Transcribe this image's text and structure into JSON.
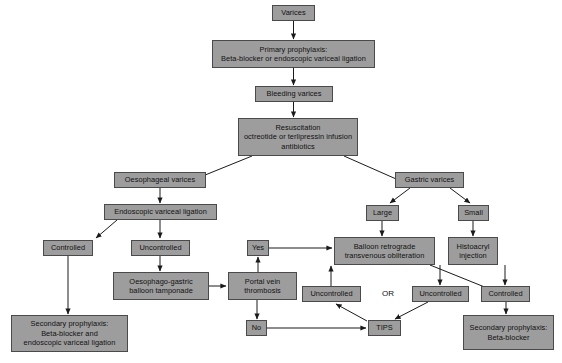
{
  "diagram": {
    "box_fill": "#9d9d9d",
    "box_border": "#4a4a4a",
    "arrow_color": "#1a1a1a",
    "canvas": {
      "width": 562,
      "height": 363
    },
    "nodes": [
      {
        "id": "varices",
        "label": "Varices",
        "x": 272,
        "y": 5,
        "w": 43,
        "h": 16
      },
      {
        "id": "primary-prophylaxis",
        "label": "Primary prophylaxis:\nBeta-blocker or endoscopic variceal ligation",
        "x": 212,
        "y": 40,
        "w": 163,
        "h": 28
      },
      {
        "id": "bleeding-varices",
        "label": "Bleeding varices",
        "x": 255,
        "y": 86,
        "w": 78,
        "h": 16
      },
      {
        "id": "resuscitation",
        "label": "Resuscitation\noctreotide or terlipressin infusion\nantibiotics",
        "x": 238,
        "y": 118,
        "w": 120,
        "h": 38
      },
      {
        "id": "oesophageal-varices",
        "label": "Oesophageal varices",
        "x": 114,
        "y": 172,
        "w": 92,
        "h": 16
      },
      {
        "id": "gastric-varices",
        "label": "Gastric varices",
        "x": 395,
        "y": 172,
        "w": 69,
        "h": 16
      },
      {
        "id": "endoscopic-variceal-ligation",
        "label": "Endoscopic variceal ligation",
        "x": 104,
        "y": 204,
        "w": 113,
        "h": 16
      },
      {
        "id": "large",
        "label": "Large",
        "x": 366,
        "y": 205,
        "w": 33,
        "h": 16
      },
      {
        "id": "small",
        "label": "Small",
        "x": 458,
        "y": 205,
        "w": 31,
        "h": 16
      },
      {
        "id": "controlled-left",
        "label": "Controlled",
        "x": 43,
        "y": 240,
        "w": 50,
        "h": 16
      },
      {
        "id": "uncontrolled-left",
        "label": "Uncontrolled",
        "x": 131,
        "y": 240,
        "w": 59,
        "h": 16
      },
      {
        "id": "yes",
        "label": "Yes",
        "x": 247,
        "y": 240,
        "w": 22,
        "h": 16
      },
      {
        "id": "balloon-retrograde",
        "label": "Balloon retrograde\ntransvenous obliteration",
        "x": 334,
        "y": 237,
        "w": 101,
        "h": 28
      },
      {
        "id": "histoacryl",
        "label": "Histoacryl\ninjection",
        "x": 448,
        "y": 237,
        "w": 50,
        "h": 28
      },
      {
        "id": "oesophago-gastric-balloon",
        "label": "Oesophago-gastric\nballoon tamponade",
        "x": 113,
        "y": 272,
        "w": 96,
        "h": 28
      },
      {
        "id": "portal-vein-thrombosis",
        "label": "Portal vein\nthrombosis",
        "x": 228,
        "y": 272,
        "w": 69,
        "h": 28
      },
      {
        "id": "uncontrolled-middle",
        "label": "Uncontrolled",
        "x": 302,
        "y": 286,
        "w": 59,
        "h": 16
      },
      {
        "id": "uncontrolled-right",
        "label": "Uncontrolled",
        "x": 412,
        "y": 286,
        "w": 57,
        "h": 16
      },
      {
        "id": "controlled-right",
        "label": "Controlled",
        "x": 481,
        "y": 286,
        "w": 49,
        "h": 16
      },
      {
        "id": "no",
        "label": "No",
        "x": 246,
        "y": 320,
        "w": 21,
        "h": 16
      },
      {
        "id": "tips",
        "label": "TIPS",
        "x": 368,
        "y": 320,
        "w": 33,
        "h": 16
      },
      {
        "id": "secondary-prophylaxis-left",
        "label": "Secondary prophylaxis:\nBeta-blocker and\nendoscopic variceal ligation",
        "x": 11,
        "y": 315,
        "w": 117,
        "h": 37
      },
      {
        "id": "secondary-prophylaxis-right",
        "label": "Secondary prophylaxis:\nBeta-blocker",
        "x": 463,
        "y": 315,
        "w": 91,
        "h": 35
      }
    ],
    "or_label": {
      "id": "or-connector",
      "label": "OR",
      "x": 377,
      "y": 286,
      "w": 22,
      "h": 16
    },
    "edges": [
      {
        "from": "varices",
        "to": "primary-prophylaxis",
        "points": "293.5,21 293.5,39"
      },
      {
        "from": "primary-prophylaxis",
        "to": "bleeding-varices",
        "points": "293.5,68 293.5,85"
      },
      {
        "from": "bleeding-varices",
        "to": "resuscitation",
        "points": "293.5,102 293.5,117"
      },
      {
        "from": "resuscitation",
        "to": "oesophageal-varices",
        "points": "252,156 178,186"
      },
      {
        "from": "resuscitation",
        "to": "gastric-varices",
        "points": "344,156 412,186"
      },
      {
        "from": "oesophageal-varices",
        "to": "endoscopic-variceal-ligation",
        "points": "160,188 160,203"
      },
      {
        "from": "gastric-varices",
        "to": "large",
        "points": "410,188 390,203"
      },
      {
        "from": "gastric-varices",
        "to": "small",
        "points": "450,188 470,203"
      },
      {
        "from": "endoscopic-variceal-ligation",
        "to": "controlled-left",
        "points": "117,220 96,238"
      },
      {
        "from": "endoscopic-variceal-ligation",
        "to": "uncontrolled-left",
        "points": "160,220 160,238"
      },
      {
        "from": "large",
        "to": "balloon-retrograde",
        "points": "382,221 382,236"
      },
      {
        "from": "small",
        "to": "histoacryl",
        "points": "473,221 473,236"
      },
      {
        "from": "uncontrolled-left",
        "to": "oesophago-gastric-balloon",
        "points": "160,256 160,271"
      },
      {
        "from": "oesophago-gastric-balloon",
        "to": "portal-vein-thrombosis",
        "points": "209,286 226,286"
      },
      {
        "from": "portal-vein-thrombosis",
        "to": "yes",
        "points": "258,272 258,257"
      },
      {
        "from": "portal-vein-thrombosis",
        "to": "no",
        "points": "257,300 257,319"
      },
      {
        "from": "yes",
        "to": "balloon-retrograde",
        "points": "269,248 332,248"
      },
      {
        "from": "uncontrolled-middle",
        "to": "balloon-retrograde",
        "points": "331,286 331,266"
      },
      {
        "from": "balloon-retrograde",
        "to": "uncontrolled-middle",
        "points": "331,286 331,266"
      },
      {
        "from": "balloon-retrograde",
        "to": "uncontrolled-right",
        "points": "440,265 440,285"
      },
      {
        "from": "histoacryl",
        "to": "controlled-right",
        "points": "505,265 505,285"
      },
      {
        "from": "balloon-retrograde",
        "to": "controlled-right",
        "points": "430,265 497,292"
      },
      {
        "from": "no",
        "to": "tips",
        "points": "267,328 366,328"
      },
      {
        "from": "uncontrolled-right",
        "to": "tips",
        "points": "428,302 395,319"
      },
      {
        "from": "tips",
        "to": "uncontrolled-middle",
        "points": "367,321 336,304"
      },
      {
        "from": "controlled-left",
        "to": "secondary-prophylaxis-left",
        "points": "68,256 68,314"
      },
      {
        "from": "controlled-right",
        "to": "secondary-prophylaxis-right",
        "points": "506,302 506,314"
      }
    ]
  }
}
